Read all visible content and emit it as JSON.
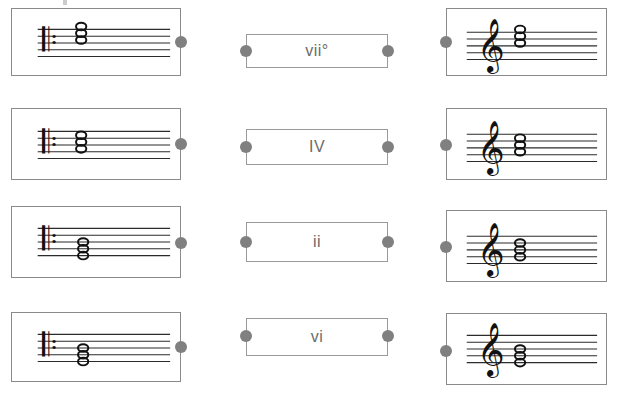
{
  "page": {
    "background_color": "#ffffff",
    "box_border_color": "#8c8c8c",
    "dot_color": "#808080",
    "notation_color": "#111111",
    "text_color": "#6b6b6b"
  },
  "columns": {
    "left": {
      "name": "bass-clef-column",
      "clef": "bass-clef",
      "clef_glyph": "𝄢"
    },
    "middle": {
      "name": "roman-numeral-column"
    },
    "right": {
      "name": "treble-clef-column",
      "clef": "treble-clef",
      "clef_glyph": "𝄞"
    }
  },
  "rows": [
    {
      "id": "row-1",
      "left": {
        "name": "bass-clef-chord-1",
        "clef": "bass-clef",
        "chord_position": "upper",
        "note_count": 3,
        "note_glyph": "⚬"
      },
      "middle": {
        "name": "roman-numeral-vii-dim",
        "label": "vii°"
      },
      "right": {
        "name": "treble-clef-chord-1",
        "clef": "treble-clef",
        "chord_position": "upper",
        "note_count": 3,
        "note_glyph": "⚬"
      }
    },
    {
      "id": "row-2",
      "left": {
        "name": "bass-clef-chord-2",
        "clef": "bass-clef",
        "chord_position": "middle",
        "note_count": 3,
        "note_glyph": "⚬"
      },
      "middle": {
        "name": "roman-numeral-four",
        "label": "IV"
      },
      "right": {
        "name": "treble-clef-chord-2",
        "clef": "treble-clef",
        "chord_position": "middle",
        "note_count": 3,
        "note_glyph": "⚬"
      }
    },
    {
      "id": "row-3",
      "left": {
        "name": "bass-clef-chord-3",
        "clef": "bass-clef",
        "chord_position": "lower",
        "note_count": 3,
        "note_glyph": "⚬"
      },
      "middle": {
        "name": "roman-numeral-two",
        "label": "ii"
      },
      "right": {
        "name": "treble-clef-chord-3",
        "clef": "treble-clef",
        "chord_position": "middle",
        "note_count": 3,
        "note_glyph": "⚬"
      }
    },
    {
      "id": "row-4",
      "left": {
        "name": "bass-clef-chord-4",
        "clef": "bass-clef",
        "chord_position": "lower",
        "note_count": 3,
        "note_glyph": "⚬"
      },
      "middle": {
        "name": "roman-numeral-six",
        "label": "vi"
      },
      "right": {
        "name": "treble-clef-chord-4",
        "clef": "treble-clef",
        "chord_position": "lower",
        "note_count": 3,
        "note_glyph": "⚬"
      }
    }
  ]
}
